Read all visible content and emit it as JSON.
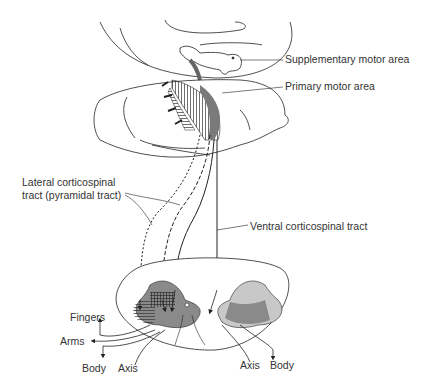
{
  "diagram": {
    "labels": {
      "supplementary_motor_area": "Supplementary motor area",
      "primary_motor_area": "Primary motor area",
      "lateral_tract_line1": "Lateral corticospinal",
      "lateral_tract_line2": "tract (pyramidal tract)",
      "ventral_tract": "Ventral corticospinal tract",
      "fingers": "Fingers",
      "arms": "Arms",
      "body_left": "Body",
      "axis_left": "Axis",
      "axis_right": "Axis",
      "body_right": "Body"
    },
    "colors": {
      "line": "#222222",
      "gray_matter_dark": "#8a8a8a",
      "gray_matter_light": "#c8c8c8",
      "motor_strip": "#7a7a7a",
      "background": "#ffffff"
    }
  }
}
